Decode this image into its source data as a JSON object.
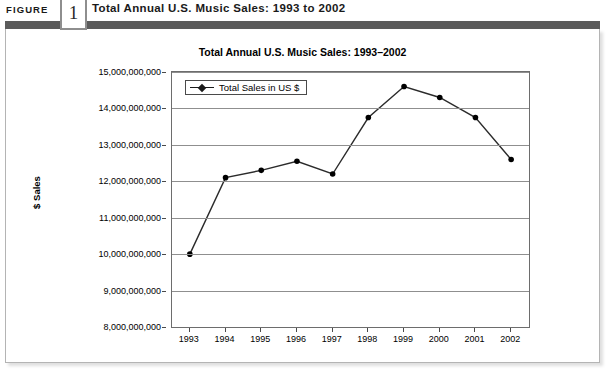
{
  "figure": {
    "label": "FIGURE",
    "number": "1",
    "caption": "Total Annual U.S. Music Sales: 1993 to 2002"
  },
  "chart_data": {
    "type": "line",
    "title": "Total Annual U.S. Music Sales: 1993–2002",
    "xlabel": "",
    "ylabel": "$ Sales",
    "categories": [
      "1993",
      "1994",
      "1995",
      "1996",
      "1997",
      "1998",
      "1999",
      "2000",
      "2001",
      "2002"
    ],
    "series": [
      {
        "name": "Total Sales in US $",
        "values": [
          10000000000,
          12100000000,
          12300000000,
          12550000000,
          12200000000,
          13750000000,
          14600000000,
          14300000000,
          13750000000,
          12600000000
        ]
      }
    ],
    "ylim": [
      8000000000,
      15000000000
    ],
    "ytick_labels": [
      "15,000,000,000",
      "14,000,000,000",
      "13,000,000,000",
      "12,000,000,000",
      "11,000,000,000",
      "10,000,000,000",
      "9,000,000,000",
      "8,000,000,000"
    ],
    "ytick_values": [
      15000000000,
      14000000000,
      13000000000,
      12000000000,
      11000000000,
      10000000000,
      9000000000,
      8000000000
    ],
    "grid": true,
    "legend_position": "top-left",
    "line_color": "#2b2b2b",
    "marker_color": "#000000",
    "plot_background": "#ffffff"
  },
  "legend": {
    "entries": [
      {
        "label": "Total Sales in US $"
      }
    ]
  }
}
